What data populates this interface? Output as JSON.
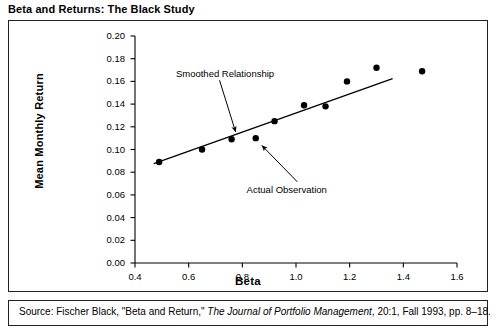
{
  "exhibit": {
    "title": "Beta and Returns: The Black Study",
    "source_prefix": "Source:  Fischer Black, \"Beta and Return,\" ",
    "source_italic": "The Journal of Portfolio Management",
    "source_suffix": ", 20:1, Fall 1993, pp. 8–18."
  },
  "chart_data": {
    "type": "scatter",
    "title": "Beta and Returns: The Black Study",
    "xlabel": "Beta",
    "ylabel": "Mean Monthly Return",
    "xlim": [
      0.4,
      1.6
    ],
    "ylim": [
      0.0,
      0.2
    ],
    "grid": false,
    "legend": "none",
    "xticks": [
      "0.4",
      "0.6",
      "0.8",
      "1.0",
      "1.2",
      "1.4",
      "1.6"
    ],
    "xtick_values": [
      0.4,
      0.6,
      0.8,
      1.0,
      1.2,
      1.4,
      1.6
    ],
    "yticks": [
      "0.00",
      "0.02",
      "0.04",
      "0.06",
      "0.08",
      "0.10",
      "0.12",
      "0.14",
      "0.16",
      "0.18",
      "0.20"
    ],
    "ytick_values": [
      0.0,
      0.02,
      0.04,
      0.06,
      0.08,
      0.1,
      0.12,
      0.14,
      0.16,
      0.18,
      0.2
    ],
    "series": [
      {
        "name": "Actual Observation",
        "type": "scatter",
        "marker": "filled-circle",
        "color": "#000000",
        "x": [
          0.49,
          0.65,
          0.76,
          0.85,
          0.92,
          1.03,
          1.11,
          1.19,
          1.3,
          1.47
        ],
        "y": [
          0.089,
          0.1,
          0.109,
          0.11,
          0.125,
          0.139,
          0.138,
          0.16,
          0.172,
          0.169
        ]
      },
      {
        "name": "Smoothed Relationship",
        "type": "line",
        "color": "#000000",
        "x": [
          0.47,
          1.36
        ],
        "y": [
          0.0875,
          0.1625
        ]
      }
    ],
    "annotations": [
      {
        "text": "Smoothed Relationship",
        "label_x": 0.735,
        "label_y": 0.1665,
        "arrow_from_x": 0.715,
        "arrow_from_y": 0.161,
        "arrow_to_x": 0.775,
        "arrow_to_y": 0.1155
      },
      {
        "text": "Actual Observation",
        "label_x": 0.965,
        "label_y": 0.0645,
        "arrow_from_x": 1.005,
        "arrow_from_y": 0.0715,
        "arrow_to_x": 0.873,
        "arrow_to_y": 0.1035
      }
    ]
  }
}
